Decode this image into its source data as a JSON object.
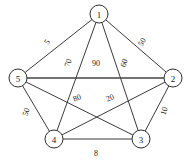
{
  "figure": {
    "background_color": "#ffffff",
    "edge_color": "#3b3b3b",
    "node_fill": "#ffffff",
    "node_stroke": "#2e2e2e",
    "text_color": "#1a1a1a"
  },
  "chart_data": {
    "type": "diagram",
    "diagram_type": "weighted-undirected-graph",
    "title": "",
    "nodes": [
      {
        "id": "1",
        "label": "1",
        "x": 99,
        "y": 14
      },
      {
        "id": "2",
        "label": "2",
        "x": 173,
        "y": 78
      },
      {
        "id": "3",
        "label": "3",
        "x": 141,
        "y": 139
      },
      {
        "id": "4",
        "label": "4",
        "x": 54,
        "y": 139
      },
      {
        "id": "5",
        "label": "5",
        "x": 18,
        "y": 78
      }
    ],
    "node_radius": 9,
    "edges": [
      {
        "source": "1",
        "target": "5",
        "weight": "5",
        "label_x": 47,
        "label_y": 42,
        "label_rotation": -55,
        "thick": false
      },
      {
        "source": "1",
        "target": "2",
        "weight": "50",
        "label_x": 142,
        "label_y": 42,
        "label_rotation": -57,
        "thick": false
      },
      {
        "source": "1",
        "target": "4",
        "weight": "70",
        "label_x": 68,
        "label_y": 63,
        "label_rotation": -72,
        "thick": false
      },
      {
        "source": "1",
        "target": "3",
        "weight": "60",
        "label_x": 124,
        "label_y": 63,
        "label_rotation": -73,
        "thick": false
      },
      {
        "source": "5",
        "target": "2",
        "weight": "90",
        "label_x": 96,
        "label_y": 63,
        "label_rotation": 0,
        "thick": true
      },
      {
        "source": "5",
        "target": "4",
        "weight": "50",
        "label_x": 26,
        "label_y": 112,
        "label_rotation": -72,
        "thick": false
      },
      {
        "source": "5",
        "target": "3",
        "weight": "80",
        "label_x": 77,
        "label_y": 98,
        "label_rotation": -22,
        "thick": false
      },
      {
        "source": "4",
        "target": "2",
        "weight": "20",
        "label_x": 110,
        "label_y": 98,
        "label_rotation": -22,
        "thick": false
      },
      {
        "source": "2",
        "target": "3",
        "weight": "10",
        "label_x": 164,
        "label_y": 111,
        "label_rotation": -72,
        "thick": false
      },
      {
        "source": "4",
        "target": "3",
        "weight": "8",
        "label_x": 96,
        "label_y": 153,
        "label_rotation": 0,
        "thick": false
      }
    ],
    "axis": {
      "grid": false,
      "legend": false
    }
  }
}
